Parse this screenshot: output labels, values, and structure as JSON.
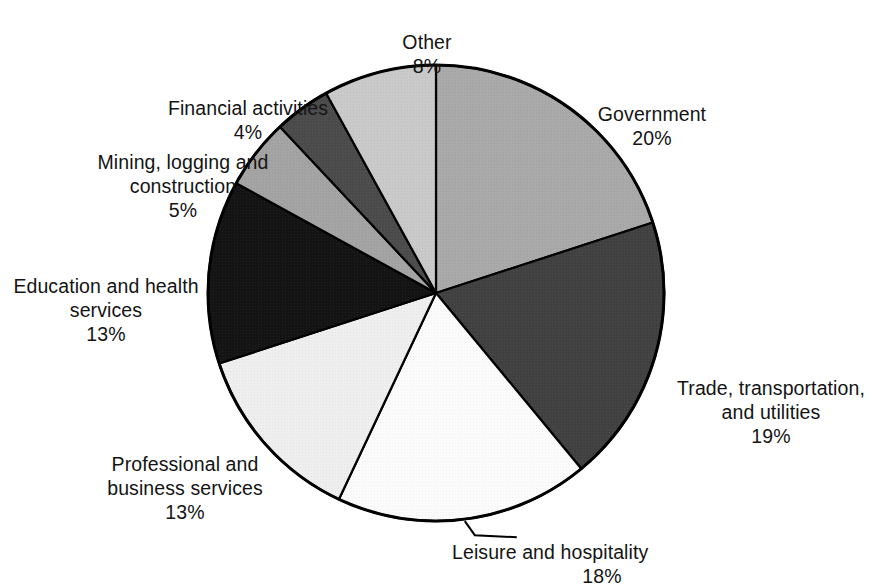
{
  "chart_data": {
    "type": "pie",
    "title": "",
    "subtitle": "",
    "xlabel": "",
    "ylabel": "",
    "legend_position": "none",
    "grid": false,
    "units": "percent",
    "center": {
      "x": 436,
      "y": 293
    },
    "radius": 228,
    "start_angle_deg": -90,
    "direction": "clockwise",
    "categories": [
      "Government",
      "Trade, transportation, and utilities",
      "Leisure and hospitality",
      "Professional and business services",
      "Education and health services",
      "Mining, logging and construction",
      "Financial activities",
      "Other"
    ],
    "values": [
      20,
      19,
      18,
      13,
      13,
      5,
      4,
      8
    ],
    "slices": [
      {
        "name": "Government",
        "label": "Government",
        "value": 20,
        "value_label": "20%",
        "color": "#a9a9a9",
        "label_align": "center",
        "leader_line": false
      },
      {
        "name": "Trade, transportation, and utilities",
        "label": "Trade, transportation,\nand utilities",
        "value": 19,
        "value_label": "19%",
        "color": "#414141",
        "label_align": "center",
        "leader_line": false
      },
      {
        "name": "Leisure and hospitality",
        "label": "Leisure and hospitality",
        "value": 18,
        "value_label": "18%",
        "color": "#fbfbfb",
        "label_align": "center",
        "leader_line": true
      },
      {
        "name": "Professional and business services",
        "label": "Professional and\nbusiness services",
        "value": 13,
        "value_label": "13%",
        "color": "#eeeeee",
        "label_align": "center",
        "leader_line": false
      },
      {
        "name": "Education and health services",
        "label": "Education and health\nservices",
        "value": 13,
        "value_label": "13%",
        "color": "#141414",
        "label_align": "center",
        "leader_line": false
      },
      {
        "name": "Mining, logging and construction",
        "label": "Mining, logging and\nconstruction",
        "value": 5,
        "value_label": "5%",
        "color": "#a3a3a3",
        "label_align": "center",
        "leader_line": false
      },
      {
        "name": "Financial activities",
        "label": "Financial activities",
        "value": 4,
        "value_label": "4%",
        "color": "#4b4b4b",
        "label_align": "center",
        "leader_line": false
      },
      {
        "name": "Other",
        "label": "Other",
        "value": 8,
        "value_label": "8%",
        "color": "#c9c9c9",
        "label_align": "center",
        "leader_line": false
      }
    ],
    "outline_color": "#000000",
    "background": "#ffffff"
  },
  "labels": {
    "government": {
      "text": "Government",
      "pct": "20%"
    },
    "trade": {
      "text": "Trade, transportation,\nand utilities",
      "pct": "19%"
    },
    "leisure": {
      "text": "Leisure and hospitality",
      "pct": "18%"
    },
    "professional": {
      "text": "Professional and\nbusiness services",
      "pct": "13%"
    },
    "education": {
      "text": "Education and health\nservices",
      "pct": "13%"
    },
    "mining": {
      "text": "Mining, logging and\nconstruction",
      "pct": "5%"
    },
    "financial": {
      "text": "Financial activities",
      "pct": "4%"
    },
    "other": {
      "text": "Other",
      "pct": "8%"
    }
  }
}
